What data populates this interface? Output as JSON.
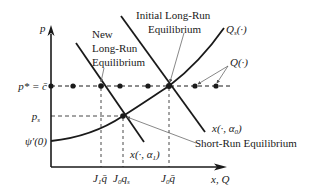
{
  "axes": {
    "y_label": "p",
    "x_label": "x, Q"
  },
  "y_ticks": {
    "p_star": "p* = c̄",
    "p_s": "p",
    "p_s_sub": "s",
    "psi": "ψ′(0)"
  },
  "x_ticks": {
    "j1q": "J",
    "j1q_sub": "1",
    "j1q_tail": "q̄",
    "j0qs": "J",
    "j0qs_sub": "0",
    "j0qs_tail": "q",
    "j0qs_tail_sub": "s",
    "j0q": "J",
    "j0q_sub": "0",
    "j0q_tail": "q̄"
  },
  "annotations": {
    "new_lr_line1": "New",
    "new_lr_line2": "Long-Run",
    "new_lr_line3": "Equilibrium",
    "initial_lr_line1": "Initial Long-Run",
    "initial_lr_line2": "Equilibrium",
    "short_run": "Short-Run Equilibrium"
  },
  "curves": {
    "qs": "Q",
    "qs_sub": "s",
    "qs_tail": "(·)",
    "q": "Q(·)",
    "x_alpha0": "x(·, α",
    "x_alpha0_sub": "0",
    "x_alpha0_tail": ")",
    "x_alpha1": "x(·, α",
    "x_alpha1_sub": "1",
    "x_alpha1_tail": ")"
  },
  "colors": {
    "ink": "#1a1a1a",
    "pointer": "#555555"
  }
}
